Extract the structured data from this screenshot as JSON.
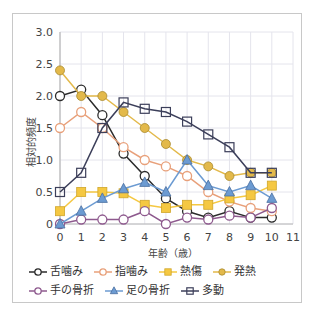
{
  "chart_data": {
    "type": "line",
    "title": "",
    "xlabel": "年齢（歳）",
    "ylabel": "相対的頻度",
    "x": [
      0,
      1,
      2,
      3,
      4,
      5,
      6,
      7,
      8,
      9,
      10
    ],
    "x_ticks": [
      "0",
      "1",
      "2",
      "3",
      "4",
      "5",
      "6",
      "7",
      "8",
      "9",
      "10",
      "11"
    ],
    "y_ticks": [
      "0",
      "0.5",
      "1.0",
      "1.5",
      "2.0",
      "2.5",
      "3.0"
    ],
    "xlim": [
      0,
      11
    ],
    "ylim": [
      0,
      3.0
    ],
    "grid": true,
    "legend_position": "bottom",
    "series": [
      {
        "name": "舌噛み",
        "color": "#2b2b2b",
        "marker": "circle-open",
        "values": [
          2.0,
          2.1,
          1.7,
          1.1,
          0.75,
          0.4,
          0.2,
          0.1,
          0.2,
          0.1,
          0.1
        ]
      },
      {
        "name": "指噛み",
        "color": "#e8a07a",
        "marker": "circle-open",
        "values": [
          1.5,
          1.75,
          1.5,
          1.2,
          1.0,
          0.9,
          0.75,
          0.5,
          0.35,
          0.25,
          0.2
        ]
      },
      {
        "name": "熱傷",
        "color": "#f5c842",
        "marker": "square-filled",
        "values": [
          0.2,
          0.5,
          0.5,
          0.48,
          0.3,
          0.25,
          0.3,
          0.3,
          0.4,
          0.45,
          0.6
        ]
      },
      {
        "name": "発熱",
        "color": "#e3b94a",
        "marker": "circle-filled",
        "values": [
          2.4,
          2.0,
          2.0,
          1.75,
          1.5,
          1.25,
          1.0,
          0.9,
          0.75,
          0.8,
          0.8
        ]
      },
      {
        "name": "手の骨折",
        "color": "#8e5a8e",
        "marker": "circle-open",
        "values": [
          0.0,
          0.07,
          0.07,
          0.07,
          0.2,
          0.0,
          0.1,
          0.07,
          0.13,
          0.1,
          0.25
        ]
      },
      {
        "name": "足の骨折",
        "color": "#6c9bd2",
        "marker": "triangle-filled",
        "values": [
          0.0,
          0.2,
          0.4,
          0.55,
          0.65,
          0.5,
          1.0,
          0.6,
          0.5,
          0.6,
          0.4
        ]
      },
      {
        "name": "多動",
        "color": "#3c3f5a",
        "marker": "square-open",
        "values": [
          0.5,
          0.8,
          1.5,
          1.9,
          1.8,
          1.75,
          1.6,
          1.4,
          1.2,
          0.8,
          0.8
        ]
      }
    ]
  },
  "legend": {
    "row1": [
      "舌噛み",
      "指噛み",
      "熱傷",
      "発熱"
    ],
    "row2": [
      "手の骨折",
      "足の骨折",
      "多動"
    ]
  }
}
